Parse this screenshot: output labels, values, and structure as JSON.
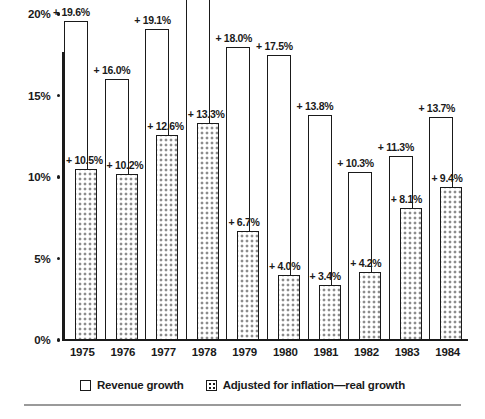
{
  "chart_data": {
    "type": "bar",
    "title": "",
    "subtitle": "",
    "xlabel": "",
    "ylabel": "",
    "categories": [
      "1975",
      "1976",
      "1977",
      "1978",
      "1979",
      "1980",
      "1981",
      "1982",
      "1983",
      "1984"
    ],
    "ylim": [
      0,
      20
    ],
    "ytick_values": [
      0,
      5,
      10,
      15,
      20
    ],
    "ytick_labels": [
      "0%",
      "5%",
      "10%",
      "15%",
      "20%"
    ],
    "grid": false,
    "legend_position": "bottom-center",
    "series": [
      {
        "name": "Revenue growth",
        "style": "outline",
        "values": [
          19.6,
          16.0,
          19.1,
          21.0,
          18.0,
          17.5,
          13.8,
          10.3,
          11.3,
          13.7
        ],
        "labels": [
          "+ 19.6%",
          "+ 16.0%",
          "+ 19.1%",
          "+ 21.0%",
          "+ 18.0%",
          "+ 17.5%",
          "+ 13.8%",
          "+ 10.3%",
          "+ 11.3%",
          "+ 13.7%"
        ]
      },
      {
        "name": "Adjusted for inflation—real growth",
        "style": "dotted",
        "values": [
          10.5,
          10.2,
          12.6,
          13.3,
          6.7,
          4.0,
          3.4,
          4.2,
          8.1,
          9.4
        ],
        "labels": [
          "+ 10.5%",
          "+ 10.2%",
          "+ 12.6%",
          "+ 13.3%",
          "+ 6.7%",
          "+ 4.0%",
          "+ 3.4%",
          "+ 4.2%",
          "+ 8.1%",
          "+ 9.4%"
        ]
      }
    ]
  },
  "legend": {
    "items": [
      {
        "label": "Revenue growth",
        "swatch": "outline-swatch"
      },
      {
        "label": "Adjusted for inflation—real growth",
        "swatch": "dotted-swatch"
      }
    ]
  },
  "colors": {
    "ink": "#1a1a1a",
    "background": "#ffffff",
    "rule": "#9a9a9a"
  }
}
